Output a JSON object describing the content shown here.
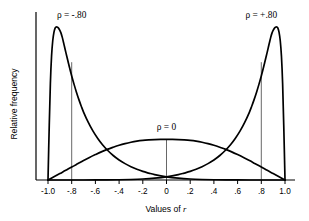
{
  "chart_data": {
    "type": "line",
    "title": "",
    "xlabel": "Values of r",
    "ylabel": "Relative frequency",
    "xlim": [
      -1.0,
      1.0
    ],
    "ylim": [
      0,
      1.0
    ],
    "grid": false,
    "legend_position": "inline-annotations",
    "xticks": [
      -1.0,
      -0.8,
      -0.6,
      -0.4,
      -0.2,
      0,
      0.2,
      0.4,
      0.6,
      0.8,
      1.0
    ],
    "xticklabels": [
      "-1.0",
      "-.8",
      "-.6",
      "-.4",
      "-.2",
      "0",
      ".2",
      ".4",
      ".6",
      ".8",
      "1.0"
    ],
    "yticks": [],
    "yticklabels": [],
    "annotations": [
      {
        "text": "ρ = -.80",
        "x": -0.8,
        "y": 1.06,
        "series": "rho_neg80"
      },
      {
        "text": "ρ = 0",
        "x": 0.0,
        "y": 0.33,
        "series": "rho_zero"
      },
      {
        "text": "ρ = +.80",
        "x": 0.8,
        "y": 1.06,
        "series": "rho_pos80"
      }
    ],
    "reference_lines": [
      {
        "x": -0.8,
        "y_top": 0.77
      },
      {
        "x": 0.0,
        "y_top": 0.265
      },
      {
        "x": 0.8,
        "y_top": 0.77
      }
    ],
    "series": [
      {
        "name": "rho_neg80",
        "rho": -0.8,
        "peak_x": -0.89,
        "peak_y": 1.0,
        "x": [
          -1.0,
          -0.99,
          -0.98,
          -0.97,
          -0.96,
          -0.95,
          -0.94,
          -0.93,
          -0.92,
          -0.91,
          -0.9,
          -0.89,
          -0.88,
          -0.87,
          -0.86,
          -0.85,
          -0.84,
          -0.82,
          -0.8,
          -0.78,
          -0.76,
          -0.74,
          -0.72,
          -0.7,
          -0.66,
          -0.62,
          -0.58,
          -0.54,
          -0.5,
          -0.45,
          -0.4,
          -0.35,
          -0.3,
          -0.25,
          -0.2,
          -0.15,
          -0.1,
          0.0,
          0.1,
          0.2,
          0.3,
          0.4,
          0.5,
          0.6,
          0.7,
          0.8,
          0.9,
          1.0
        ],
        "y": [
          0.0,
          0.34,
          0.63,
          0.81,
          0.91,
          0.965,
          0.993,
          1.0,
          0.998,
          0.991,
          0.978,
          0.96,
          0.934,
          0.902,
          0.869,
          0.836,
          0.804,
          0.74,
          0.68,
          0.625,
          0.574,
          0.527,
          0.484,
          0.444,
          0.376,
          0.319,
          0.271,
          0.23,
          0.196,
          0.16,
          0.131,
          0.107,
          0.087,
          0.07,
          0.056,
          0.045,
          0.035,
          0.021,
          0.012,
          0.0065,
          0.0034,
          0.0016,
          0.0007,
          0.0003,
          0.0001,
          3e-05,
          5e-06,
          0.0
        ]
      },
      {
        "name": "rho_zero",
        "rho": 0.0,
        "peak_x": 0.0,
        "peak_y": 0.265,
        "x": [
          -1.0,
          -0.95,
          -0.9,
          -0.85,
          -0.8,
          -0.75,
          -0.7,
          -0.65,
          -0.6,
          -0.55,
          -0.5,
          -0.45,
          -0.4,
          -0.35,
          -0.3,
          -0.25,
          -0.2,
          -0.15,
          -0.1,
          -0.05,
          0.0,
          0.05,
          0.1,
          0.15,
          0.2,
          0.25,
          0.3,
          0.35,
          0.4,
          0.45,
          0.5,
          0.55,
          0.6,
          0.65,
          0.7,
          0.75,
          0.8,
          0.85,
          0.9,
          0.95,
          1.0
        ],
        "y": [
          0.0,
          0.021,
          0.042,
          0.063,
          0.085,
          0.106,
          0.127,
          0.147,
          0.166,
          0.184,
          0.2,
          0.214,
          0.227,
          0.238,
          0.247,
          0.254,
          0.259,
          0.262,
          0.264,
          0.265,
          0.265,
          0.265,
          0.264,
          0.262,
          0.259,
          0.254,
          0.247,
          0.238,
          0.227,
          0.214,
          0.2,
          0.184,
          0.166,
          0.147,
          0.127,
          0.106,
          0.085,
          0.063,
          0.042,
          0.021,
          0.0
        ]
      },
      {
        "name": "rho_pos80",
        "rho": 0.8,
        "peak_x": 0.89,
        "peak_y": 1.0,
        "x": [
          1.0,
          0.99,
          0.98,
          0.97,
          0.96,
          0.95,
          0.94,
          0.93,
          0.92,
          0.91,
          0.9,
          0.89,
          0.88,
          0.87,
          0.86,
          0.85,
          0.84,
          0.82,
          0.8,
          0.78,
          0.76,
          0.74,
          0.72,
          0.7,
          0.66,
          0.62,
          0.58,
          0.54,
          0.5,
          0.45,
          0.4,
          0.35,
          0.3,
          0.25,
          0.2,
          0.15,
          0.1,
          0.0,
          -0.1,
          -0.2,
          -0.3,
          -0.4,
          -0.5,
          -0.6,
          -0.7,
          -0.8,
          -0.9,
          -1.0
        ],
        "y": [
          0.0,
          0.34,
          0.63,
          0.81,
          0.91,
          0.965,
          0.993,
          1.0,
          0.998,
          0.991,
          0.978,
          0.96,
          0.934,
          0.902,
          0.869,
          0.836,
          0.804,
          0.74,
          0.68,
          0.625,
          0.574,
          0.527,
          0.484,
          0.444,
          0.376,
          0.319,
          0.271,
          0.23,
          0.196,
          0.16,
          0.131,
          0.107,
          0.087,
          0.07,
          0.056,
          0.045,
          0.035,
          0.021,
          0.012,
          0.0065,
          0.0034,
          0.0016,
          0.0007,
          0.0003,
          0.0001,
          3e-05,
          5e-06,
          0.0
        ]
      }
    ]
  },
  "geometry": {
    "x_left_px": 48,
    "x_right_px": 285,
    "baseline_px": 180,
    "top_px": 27,
    "axis_y_x_px": 36,
    "axis_extend_px": 10,
    "tick_len_px": 4
  },
  "axis": {
    "xlabel_prefix": "Values of ",
    "xlabel_italic": "r",
    "ylabel": "Relative frequency"
  }
}
